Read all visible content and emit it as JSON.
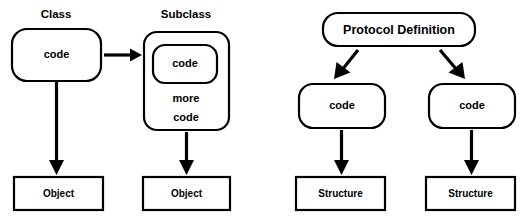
{
  "diagram": {
    "background_color": "#ffffff",
    "stroke_color": "#000000",
    "text_color": "#000000",
    "left_panel": {
      "headings": {
        "class_label": "Class",
        "subclass_label": "Subclass"
      },
      "nodes": {
        "class_code": "code",
        "subclass_inner_code": "code",
        "subclass_more": "more",
        "subclass_code": "code",
        "class_object": "Object",
        "subclass_object": "Object"
      }
    },
    "right_panel": {
      "nodes": {
        "protocol_definition": "Protocol Definition",
        "left_code": "code",
        "right_code": "code",
        "left_structure": "Structure",
        "right_structure": "Structure"
      }
    }
  }
}
